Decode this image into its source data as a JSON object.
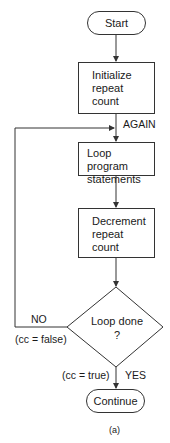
{
  "diagram": {
    "type": "flowchart",
    "caption": "(a)",
    "nodes": {
      "start": {
        "shape": "terminal",
        "label": "Start"
      },
      "init": {
        "shape": "process",
        "lines": [
          "Initialize",
          "repeat",
          "count"
        ]
      },
      "loop": {
        "shape": "process",
        "lines": [
          "Loop program",
          "statements"
        ]
      },
      "decrement": {
        "shape": "process",
        "lines": [
          "Decrement",
          "repeat",
          "count"
        ]
      },
      "decision": {
        "shape": "decision",
        "lines": [
          "Loop done",
          "?"
        ]
      },
      "continue": {
        "shape": "terminal",
        "label": "Continue"
      }
    },
    "edge_labels": {
      "again": "AGAIN",
      "no": "NO",
      "cc_false": "(cc = false)",
      "cc_true": "(cc = true)",
      "yes": "YES"
    },
    "colors": {
      "stroke": "#333333",
      "background": "#ffffff",
      "text": "#1a1a1a"
    }
  }
}
